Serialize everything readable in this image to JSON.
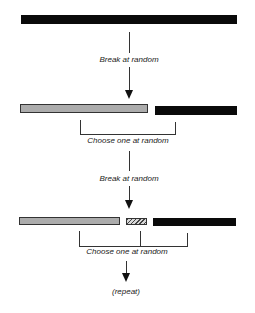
{
  "diagram": {
    "steps": [
      {
        "label": "Break at random"
      },
      {
        "label": "Choose one at random"
      },
      {
        "label": "Break at random"
      },
      {
        "label": "Choose one at random"
      },
      {
        "label": "(repeat)"
      }
    ],
    "rows": [
      {
        "segments": [
          {
            "type": "solid-black"
          }
        ]
      },
      {
        "segments": [
          {
            "type": "gray"
          },
          {
            "type": "solid-black"
          }
        ]
      },
      {
        "segments": [
          {
            "type": "gray"
          },
          {
            "type": "hatched"
          },
          {
            "type": "solid-black"
          }
        ]
      }
    ],
    "colors": {
      "black": "#0a0a0a",
      "gray": "#acacac",
      "line": "#333333"
    }
  }
}
